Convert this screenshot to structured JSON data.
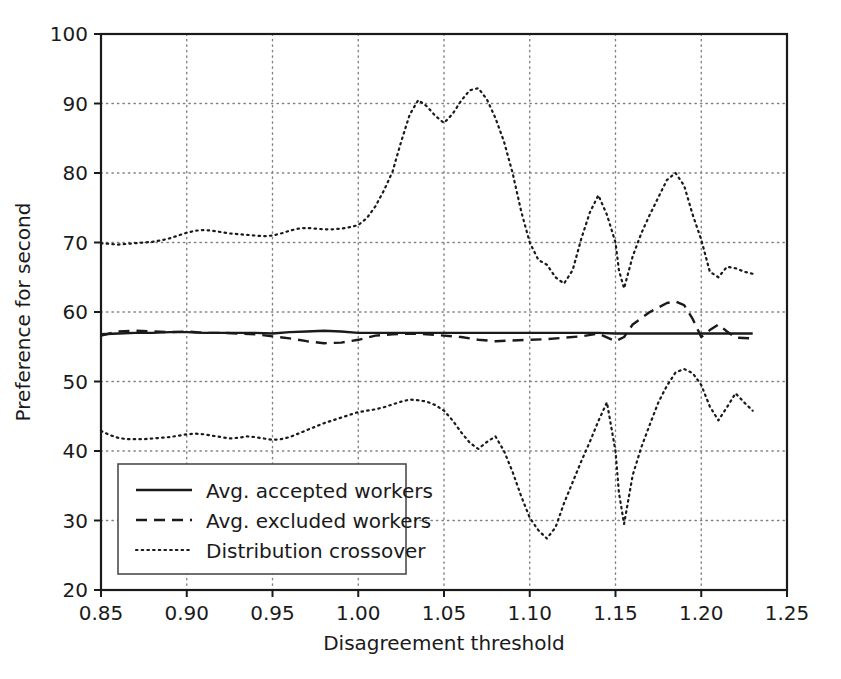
{
  "chart_data": {
    "type": "line",
    "title": "",
    "xlabel": "Disagreement threshold",
    "ylabel": "Preference for second",
    "xlim": [
      0.85,
      1.25
    ],
    "ylim": [
      20,
      100
    ],
    "xticks": [
      "0.85",
      "0.90",
      "0.95",
      "1.00",
      "1.05",
      "1.10",
      "1.15",
      "1.20",
      "1.25"
    ],
    "xtick_values": [
      0.85,
      0.9,
      0.95,
      1.0,
      1.05,
      1.1,
      1.15,
      1.2,
      1.25
    ],
    "yticks": [
      "20",
      "30",
      "40",
      "50",
      "60",
      "70",
      "80",
      "90",
      "100"
    ],
    "ytick_values": [
      20,
      30,
      40,
      50,
      60,
      70,
      80,
      90,
      100
    ],
    "grid": true,
    "grid_style": "dotted",
    "legend_position": "lower left",
    "series": [
      {
        "name": "Avg. accepted workers",
        "style": "solid",
        "color": "#1a1a1a",
        "x": [
          0.85,
          0.86,
          0.87,
          0.88,
          0.89,
          0.9,
          0.91,
          0.92,
          0.93,
          0.94,
          0.95,
          0.96,
          0.97,
          0.98,
          0.99,
          1.0,
          1.01,
          1.02,
          1.03,
          1.04,
          1.05,
          1.06,
          1.07,
          1.08,
          1.09,
          1.1,
          1.11,
          1.12,
          1.13,
          1.14,
          1.15,
          1.16,
          1.17,
          1.18,
          1.19,
          1.2,
          1.21,
          1.22,
          1.23
        ],
        "y": [
          56.8,
          56.9,
          57.0,
          57.0,
          57.1,
          57.1,
          57.0,
          57.0,
          57.0,
          57.0,
          56.9,
          57.1,
          57.2,
          57.3,
          57.2,
          57.0,
          57.0,
          57.0,
          57.0,
          57.0,
          57.0,
          57.0,
          57.0,
          57.0,
          57.0,
          57.0,
          57.0,
          57.0,
          57.0,
          57.0,
          56.9,
          56.9,
          56.9,
          56.9,
          56.9,
          56.9,
          56.9,
          56.9,
          56.9
        ]
      },
      {
        "name": "Avg. excluded workers",
        "style": "dashed",
        "color": "#1a1a1a",
        "x": [
          0.85,
          0.86,
          0.87,
          0.88,
          0.89,
          0.9,
          0.91,
          0.92,
          0.93,
          0.94,
          0.95,
          0.96,
          0.97,
          0.98,
          0.99,
          1.0,
          1.01,
          1.02,
          1.03,
          1.04,
          1.05,
          1.06,
          1.07,
          1.08,
          1.09,
          1.1,
          1.11,
          1.12,
          1.13,
          1.14,
          1.15,
          1.155,
          1.16,
          1.17,
          1.18,
          1.185,
          1.19,
          1.195,
          1.2,
          1.205,
          1.21,
          1.215,
          1.22,
          1.23
        ],
        "y": [
          56.6,
          57.2,
          57.3,
          57.2,
          57.1,
          57.2,
          57.0,
          57.0,
          56.9,
          56.8,
          56.5,
          56.2,
          55.8,
          55.5,
          55.6,
          56.0,
          56.6,
          56.8,
          56.9,
          56.8,
          56.6,
          56.4,
          56.0,
          55.8,
          55.9,
          56.0,
          56.1,
          56.3,
          56.5,
          56.9,
          55.8,
          56.4,
          58.2,
          60.0,
          61.3,
          61.5,
          61.0,
          59.0,
          56.4,
          57.4,
          58.2,
          57.2,
          56.3,
          56.2
        ]
      },
      {
        "name": "Distribution crossover",
        "style": "dotted",
        "color": "#1a1a1a",
        "branch": "upper",
        "x": [
          0.85,
          0.855,
          0.86,
          0.865,
          0.87,
          0.875,
          0.88,
          0.885,
          0.89,
          0.895,
          0.9,
          0.905,
          0.91,
          0.915,
          0.92,
          0.925,
          0.93,
          0.935,
          0.94,
          0.945,
          0.95,
          0.955,
          0.96,
          0.965,
          0.97,
          0.975,
          0.98,
          0.985,
          0.99,
          0.995,
          1.0,
          1.005,
          1.01,
          1.015,
          1.02,
          1.025,
          1.03,
          1.035,
          1.04,
          1.045,
          1.05,
          1.055,
          1.06,
          1.065,
          1.07,
          1.075,
          1.08,
          1.085,
          1.09,
          1.095,
          1.1,
          1.105,
          1.11,
          1.115,
          1.12,
          1.125,
          1.13,
          1.135,
          1.14,
          1.145,
          1.15,
          1.152,
          1.155,
          1.16,
          1.165,
          1.17,
          1.175,
          1.18,
          1.185,
          1.19,
          1.195,
          1.2,
          1.205,
          1.21,
          1.215,
          1.22,
          1.225,
          1.23
        ],
        "y": [
          69.9,
          69.8,
          69.7,
          69.8,
          69.9,
          70.0,
          70.1,
          70.3,
          70.6,
          71.0,
          71.4,
          71.7,
          71.8,
          71.7,
          71.5,
          71.3,
          71.2,
          71.1,
          71.0,
          70.9,
          71.0,
          71.3,
          71.7,
          72.0,
          72.1,
          72.0,
          71.9,
          71.9,
          72.0,
          72.2,
          72.5,
          73.5,
          75.2,
          77.5,
          80.2,
          84.5,
          88.4,
          90.5,
          89.6,
          88.2,
          87.2,
          88.5,
          90.4,
          91.9,
          92.2,
          90.6,
          87.9,
          84.5,
          80.0,
          74.5,
          70.0,
          67.5,
          66.8,
          65.0,
          64.1,
          66.0,
          70.5,
          74.3,
          76.8,
          74.0,
          70.0,
          66.0,
          63.4,
          68.0,
          71.3,
          74.0,
          76.5,
          79.0,
          80.0,
          78.2,
          74.0,
          70.4,
          65.8,
          65.0,
          66.5,
          66.3,
          65.8,
          65.5
        ]
      },
      {
        "name": "Distribution crossover",
        "style": "dotted",
        "color": "#1a1a1a",
        "branch": "lower",
        "x": [
          0.85,
          0.855,
          0.86,
          0.865,
          0.87,
          0.875,
          0.88,
          0.885,
          0.89,
          0.895,
          0.9,
          0.905,
          0.91,
          0.915,
          0.92,
          0.925,
          0.93,
          0.935,
          0.94,
          0.945,
          0.95,
          0.955,
          0.96,
          0.965,
          0.97,
          0.975,
          0.98,
          0.985,
          0.99,
          0.995,
          1.0,
          1.005,
          1.01,
          1.015,
          1.02,
          1.025,
          1.03,
          1.035,
          1.04,
          1.045,
          1.05,
          1.055,
          1.06,
          1.065,
          1.07,
          1.075,
          1.08,
          1.085,
          1.09,
          1.095,
          1.1,
          1.105,
          1.11,
          1.115,
          1.12,
          1.125,
          1.13,
          1.135,
          1.14,
          1.145,
          1.15,
          1.152,
          1.155,
          1.16,
          1.165,
          1.17,
          1.175,
          1.18,
          1.185,
          1.19,
          1.195,
          1.2,
          1.205,
          1.21,
          1.215,
          1.22,
          1.225,
          1.23
        ],
        "y": [
          42.9,
          42.3,
          41.9,
          41.7,
          41.7,
          41.7,
          41.8,
          41.9,
          42.0,
          42.2,
          42.4,
          42.5,
          42.4,
          42.2,
          42.0,
          41.8,
          41.9,
          42.1,
          42.0,
          41.8,
          41.6,
          41.7,
          42.0,
          42.5,
          43.0,
          43.5,
          44.0,
          44.4,
          44.8,
          45.2,
          45.6,
          45.8,
          46.0,
          46.3,
          46.7,
          47.1,
          47.4,
          47.3,
          47.1,
          46.6,
          45.8,
          44.4,
          42.7,
          41.2,
          40.3,
          41.3,
          42.1,
          40.0,
          37.0,
          33.5,
          30.4,
          28.6,
          27.4,
          29.0,
          32.5,
          35.5,
          38.5,
          41.3,
          44.3,
          47.0,
          40.0,
          34.0,
          29.5,
          36.5,
          40.5,
          43.8,
          47.0,
          49.4,
          51.3,
          51.8,
          51.2,
          49.5,
          46.4,
          44.4,
          46.3,
          48.3,
          47.0,
          45.8
        ]
      }
    ]
  },
  "legend": {
    "entries": [
      {
        "label": "Avg. accepted workers",
        "style": "solid"
      },
      {
        "label": "Avg. excluded workers",
        "style": "dashed"
      },
      {
        "label": "Distribution crossover",
        "style": "dotted"
      }
    ]
  },
  "colors": {
    "ink": "#1a1a1a",
    "grid": "#808080",
    "background": "#ffffff"
  }
}
